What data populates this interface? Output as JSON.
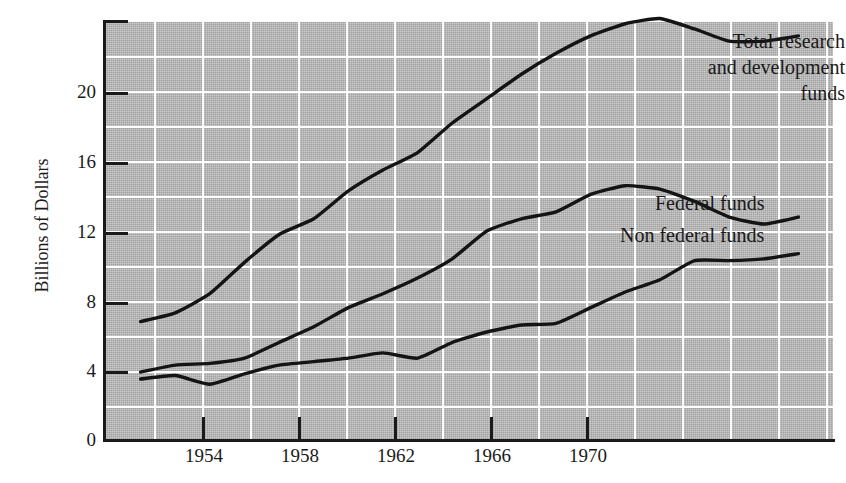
{
  "chart_data": {
    "type": "line",
    "title": "",
    "xlabel": "",
    "ylabel": "Billions of Dollars",
    "xlim": [
      1952,
      1973
    ],
    "ylim": [
      0,
      24
    ],
    "xticks": [
      "1954",
      "1958",
      "1962",
      "1966",
      "1970"
    ],
    "xtick_values": [
      1954,
      1958,
      1962,
      1966,
      1970
    ],
    "yticks": [
      "0",
      "4",
      "8",
      "12",
      "16",
      "20"
    ],
    "ytick_values": [
      0,
      4,
      8,
      12,
      16,
      20
    ],
    "grid": "white gridlines every 2 units vertically and every 1 year horizontally",
    "legend_position": "inline right-side labels at end of each curve",
    "background_color": "#b3b3b3",
    "line_color": "#141414",
    "x": [
      1953,
      1954,
      1955,
      1956,
      1957,
      1958,
      1959,
      1960,
      1961,
      1962,
      1963,
      1964,
      1965,
      1966,
      1967,
      1968,
      1969,
      1970,
      1971,
      1972
    ],
    "series": [
      {
        "name": "Total research and development funds",
        "label": "Total research\nand development\nfunds",
        "values": [
          6.8,
          7.3,
          8.4,
          10.2,
          11.8,
          12.7,
          14.3,
          15.5,
          16.5,
          18.2,
          19.6,
          21.0,
          22.2,
          23.2,
          23.9,
          24.2,
          23.6,
          22.9,
          22.9,
          23.2
        ]
      },
      {
        "name": "Federal funds",
        "label": "Federal funds",
        "values": [
          3.9,
          4.3,
          4.4,
          4.7,
          5.6,
          6.5,
          7.6,
          8.4,
          9.3,
          10.4,
          12.0,
          12.7,
          13.1,
          14.1,
          14.6,
          14.4,
          13.7,
          12.8,
          12.4,
          12.8
        ]
      },
      {
        "name": "Non federal funds",
        "label": "Non federal funds",
        "values": [
          3.5,
          3.7,
          3.2,
          3.8,
          4.3,
          4.5,
          4.7,
          5.0,
          4.7,
          5.6,
          6.2,
          6.6,
          6.7,
          7.6,
          8.5,
          9.2,
          10.3,
          10.3,
          10.4,
          10.7
        ]
      }
    ]
  },
  "axes": {
    "y_title": "Billions of Dollars",
    "y_ticks": [
      {
        "label": "20"
      },
      {
        "label": "16"
      },
      {
        "label": "12"
      },
      {
        "label": "8"
      },
      {
        "label": "4"
      },
      {
        "label": "0"
      }
    ],
    "x_ticks": [
      {
        "label": "1954"
      },
      {
        "label": "1958"
      },
      {
        "label": "1962"
      },
      {
        "label": "1966"
      },
      {
        "label": "1970"
      }
    ]
  },
  "labels": {
    "total": "Total research\nand development\nfunds",
    "federal": "Federal funds",
    "nonfederal": "Non federal funds"
  }
}
